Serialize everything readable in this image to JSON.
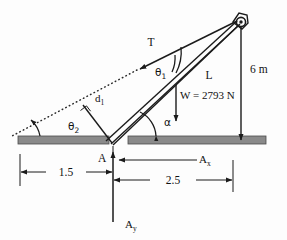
{
  "figure": {
    "type": "engineering-statics-diagram"
  },
  "labels": {
    "tension": "T",
    "theta1": "θ1",
    "theta1_base": "θ",
    "theta1_sub": "1",
    "theta2_base": "θ",
    "theta2_sub": "2",
    "boom_length": "L",
    "height": "6 m",
    "weight": "W = 2793 N",
    "alpha": "α",
    "moment_arm_base": "d",
    "moment_arm_sub": "1",
    "pin_point": "A",
    "reaction_x_base": "A",
    "reaction_x_sub": "x",
    "reaction_y_base": "A",
    "reaction_y_sub": "y",
    "dim_left": "1.5",
    "dim_right": "2.5"
  },
  "values": {
    "weight_magnitude": "2793",
    "weight_unit": "N",
    "height_value": "6",
    "height_unit": "m",
    "distance_left": "1.5",
    "distance_right": "2.5"
  },
  "colors": {
    "ink": "#1b1b1b",
    "ground": "#8a8a8a",
    "ground_edge": "#4a4a4a",
    "background": "#fdfdfd"
  },
  "icons": {
    "pin": "pin-circle-icon",
    "right_angle": "right-angle-marker-icon",
    "arrowhead": "arrowhead-icon"
  }
}
